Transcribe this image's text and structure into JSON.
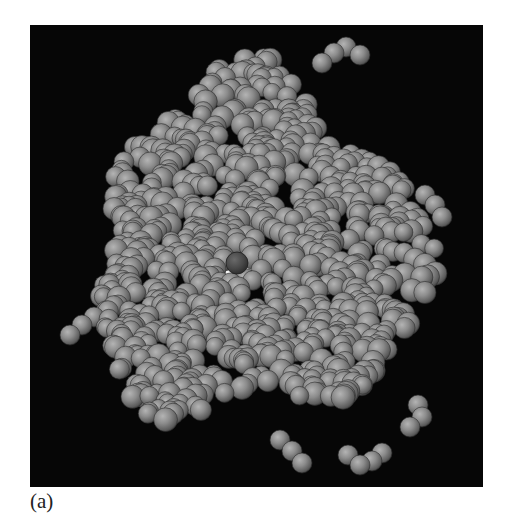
{
  "figure": {
    "caption": "(a)",
    "colors": {
      "background": "#060606",
      "atom": "#8a8a8a",
      "atom_highlight": "#b8b8b8",
      "atom_shadow": "#3a3a3a",
      "ligand_dark": "#4a4a4a",
      "pocket_light": "#e6e6e6"
    },
    "features": [
      {
        "name": "protein-surface",
        "description": "dense cluster of gray atom spheres"
      },
      {
        "name": "dark-atom",
        "description": "single darker sphere near center-left"
      },
      {
        "name": "binding-pocket",
        "description": "light/white cleft region near center"
      }
    ]
  }
}
